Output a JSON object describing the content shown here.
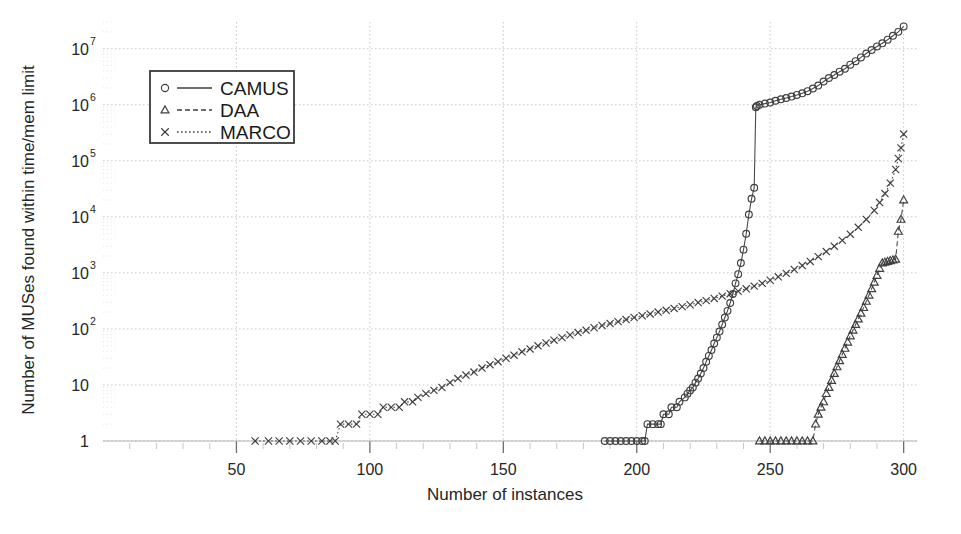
{
  "chart_data": {
    "type": "line",
    "title": "",
    "xlabel": "Number of instances",
    "ylabel": "Number of MUSes found within time/mem limit",
    "xlim": [
      0,
      305
    ],
    "ylim": [
      1,
      30000000
    ],
    "yscale": "log",
    "grid": true,
    "legend_position": "upper-left",
    "x_ticks": [
      {
        "value": 50,
        "label": "50"
      },
      {
        "value": 100,
        "label": "100"
      },
      {
        "value": 150,
        "label": "150"
      },
      {
        "value": 200,
        "label": "200"
      },
      {
        "value": 250,
        "label": "250"
      },
      {
        "value": 300,
        "label": "300"
      }
    ],
    "y_ticks": [
      {
        "value": 1,
        "mantissa": "1",
        "exponent": ""
      },
      {
        "value": 10,
        "mantissa": "10",
        "exponent": ""
      },
      {
        "value": 100,
        "mantissa": "10",
        "exponent": "2"
      },
      {
        "value": 1000,
        "mantissa": "10",
        "exponent": "3"
      },
      {
        "value": 10000,
        "mantissa": "10",
        "exponent": "4"
      },
      {
        "value": 100000,
        "mantissa": "10",
        "exponent": "5"
      },
      {
        "value": 1000000,
        "mantissa": "10",
        "exponent": "6"
      },
      {
        "value": 10000000,
        "mantissa": "10",
        "exponent": "7"
      }
    ],
    "series": [
      {
        "name": "CAMUS",
        "marker": "circle",
        "linestyle": "solid",
        "color": "#3f3f3f",
        "points": [
          [
            188,
            1
          ],
          [
            190,
            1
          ],
          [
            192,
            1
          ],
          [
            194,
            1
          ],
          [
            196,
            1
          ],
          [
            198,
            1
          ],
          [
            200,
            1
          ],
          [
            202,
            1
          ],
          [
            203,
            1
          ],
          [
            204,
            2
          ],
          [
            206,
            2
          ],
          [
            208,
            2
          ],
          [
            209,
            2
          ],
          [
            210,
            3
          ],
          [
            212,
            3
          ],
          [
            213,
            4
          ],
          [
            215,
            4
          ],
          [
            216,
            5
          ],
          [
            218,
            6
          ],
          [
            219,
            7
          ],
          [
            220,
            8
          ],
          [
            221,
            9
          ],
          [
            222,
            11
          ],
          [
            223,
            13
          ],
          [
            224,
            16
          ],
          [
            225,
            20
          ],
          [
            226,
            26
          ],
          [
            227,
            33
          ],
          [
            228,
            42
          ],
          [
            229,
            55
          ],
          [
            230,
            70
          ],
          [
            231,
            90
          ],
          [
            232,
            120
          ],
          [
            233,
            160
          ],
          [
            234,
            210
          ],
          [
            235,
            290
          ],
          [
            236,
            420
          ],
          [
            237,
            650
          ],
          [
            238,
            950
          ],
          [
            239,
            1500
          ],
          [
            240,
            2600
          ],
          [
            241,
            5000
          ],
          [
            242,
            11000
          ],
          [
            243,
            21000
          ],
          [
            244,
            33000
          ],
          [
            244.6,
            900000
          ],
          [
            245,
            950000
          ],
          [
            246,
            1000000
          ],
          [
            248,
            1050000
          ],
          [
            250,
            1100000
          ],
          [
            252,
            1180000
          ],
          [
            254,
            1250000
          ],
          [
            256,
            1320000
          ],
          [
            258,
            1400000
          ],
          [
            260,
            1500000
          ],
          [
            262,
            1600000
          ],
          [
            264,
            1750000
          ],
          [
            266,
            1950000
          ],
          [
            268,
            2200000
          ],
          [
            270,
            2600000
          ],
          [
            272,
            3000000
          ],
          [
            274,
            3400000
          ],
          [
            276,
            3900000
          ],
          [
            278,
            4400000
          ],
          [
            280,
            5200000
          ],
          [
            282,
            6000000
          ],
          [
            284,
            7000000
          ],
          [
            286,
            8200000
          ],
          [
            288,
            9500000
          ],
          [
            290,
            11000000
          ],
          [
            292,
            12500000
          ],
          [
            294,
            14500000
          ],
          [
            296,
            17000000
          ],
          [
            298,
            20000000
          ],
          [
            300,
            25000000
          ]
        ]
      },
      {
        "name": "DAA",
        "marker": "triangle",
        "linestyle": "dashed",
        "color": "#3f3f3f",
        "points": [
          [
            246,
            1
          ],
          [
            248,
            1
          ],
          [
            250,
            1
          ],
          [
            252,
            1
          ],
          [
            254,
            1
          ],
          [
            256,
            1
          ],
          [
            258,
            1
          ],
          [
            260,
            1
          ],
          [
            262,
            1
          ],
          [
            264,
            1
          ],
          [
            266,
            1
          ],
          [
            267,
            2
          ],
          [
            268,
            3
          ],
          [
            269,
            4
          ],
          [
            270,
            5
          ],
          [
            271,
            7
          ],
          [
            272,
            9
          ],
          [
            273,
            12
          ],
          [
            274,
            16
          ],
          [
            275,
            21
          ],
          [
            276,
            27
          ],
          [
            277,
            35
          ],
          [
            278,
            45
          ],
          [
            279,
            58
          ],
          [
            280,
            75
          ],
          [
            281,
            95
          ],
          [
            282,
            120
          ],
          [
            283,
            150
          ],
          [
            284,
            190
          ],
          [
            285,
            240
          ],
          [
            286,
            310
          ],
          [
            287,
            400
          ],
          [
            288,
            520
          ],
          [
            289,
            680
          ],
          [
            290,
            900
          ],
          [
            291,
            1200
          ],
          [
            292,
            1500
          ],
          [
            293,
            1550
          ],
          [
            294,
            1600
          ],
          [
            295,
            1650
          ],
          [
            296,
            1700
          ],
          [
            297,
            1750
          ],
          [
            298,
            5500
          ],
          [
            299,
            9000
          ],
          [
            300,
            20000
          ]
        ]
      },
      {
        "name": "MARCO",
        "marker": "cross",
        "linestyle": "dotted",
        "color": "#3f3f3f",
        "points": [
          [
            57,
            1
          ],
          [
            62,
            1
          ],
          [
            66,
            1
          ],
          [
            70,
            1
          ],
          [
            74,
            1
          ],
          [
            78,
            1
          ],
          [
            82,
            1
          ],
          [
            85,
            1
          ],
          [
            87,
            1
          ],
          [
            89,
            2
          ],
          [
            92,
            2
          ],
          [
            95,
            2
          ],
          [
            97,
            3
          ],
          [
            100,
            3
          ],
          [
            103,
            3
          ],
          [
            105,
            4
          ],
          [
            108,
            4
          ],
          [
            111,
            4
          ],
          [
            113,
            5
          ],
          [
            116,
            5
          ],
          [
            118,
            6
          ],
          [
            121,
            7
          ],
          [
            124,
            8
          ],
          [
            127,
            9
          ],
          [
            130,
            11
          ],
          [
            133,
            13
          ],
          [
            136,
            15
          ],
          [
            139,
            17
          ],
          [
            142,
            20
          ],
          [
            145,
            23
          ],
          [
            148,
            26
          ],
          [
            151,
            30
          ],
          [
            154,
            34
          ],
          [
            157,
            39
          ],
          [
            160,
            44
          ],
          [
            163,
            50
          ],
          [
            166,
            56
          ],
          [
            169,
            63
          ],
          [
            172,
            70
          ],
          [
            175,
            78
          ],
          [
            178,
            86
          ],
          [
            181,
            95
          ],
          [
            184,
            105
          ],
          [
            187,
            115
          ],
          [
            190,
            125
          ],
          [
            193,
            135
          ],
          [
            196,
            147
          ],
          [
            199,
            160
          ],
          [
            202,
            172
          ],
          [
            205,
            185
          ],
          [
            208,
            200
          ],
          [
            211,
            215
          ],
          [
            214,
            232
          ],
          [
            217,
            250
          ],
          [
            220,
            270
          ],
          [
            223,
            295
          ],
          [
            226,
            320
          ],
          [
            229,
            350
          ],
          [
            232,
            385
          ],
          [
            235,
            425
          ],
          [
            238,
            470
          ],
          [
            241,
            520
          ],
          [
            244,
            580
          ],
          [
            247,
            650
          ],
          [
            250,
            740
          ],
          [
            253,
            850
          ],
          [
            256,
            980
          ],
          [
            259,
            1150
          ],
          [
            262,
            1350
          ],
          [
            265,
            1600
          ],
          [
            268,
            1950
          ],
          [
            271,
            2400
          ],
          [
            274,
            3000
          ],
          [
            277,
            3800
          ],
          [
            280,
            4900
          ],
          [
            283,
            6500
          ],
          [
            286,
            9000
          ],
          [
            289,
            13000
          ],
          [
            291,
            18000
          ],
          [
            293,
            26000
          ],
          [
            295,
            40000
          ],
          [
            297,
            70000
          ],
          [
            298,
            110000
          ],
          [
            299,
            170000
          ],
          [
            300,
            300000
          ]
        ]
      }
    ]
  },
  "legend": {
    "entries": [
      {
        "label": "CAMUS",
        "marker": "circle",
        "linestyle": "solid"
      },
      {
        "label": "DAA",
        "marker": "triangle",
        "linestyle": "dashed"
      },
      {
        "label": "MARCO",
        "marker": "cross",
        "linestyle": "dotted"
      }
    ]
  }
}
